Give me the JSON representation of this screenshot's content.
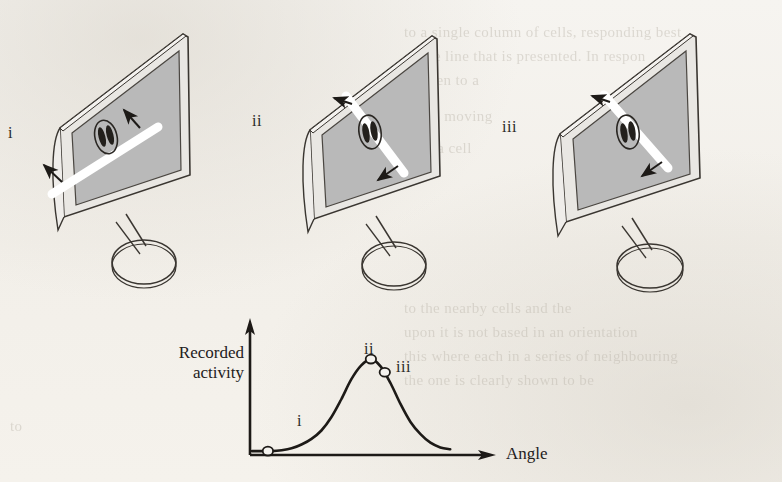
{
  "figure": {
    "type": "orientation-tuning-diagram",
    "background_color": "#f4f2ee",
    "ink_color": "#2a2723",
    "screen_fill": "#b9b9b9",
    "bar_color": "#ffffff"
  },
  "panels": [
    {
      "id": "i",
      "label": "i",
      "label_x": 8,
      "label_y": 132,
      "bar_orientation_deg": -22,
      "description": "monitor displaying white bar tilted shallow, arrows at both ends pointing up-right and down-left"
    },
    {
      "id": "ii",
      "label": "ii",
      "label_x": 252,
      "label_y": 120,
      "bar_orientation_deg": 55,
      "description": "monitor displaying white bar tilted steeply, arrows pointing up-left and down-right"
    },
    {
      "id": "iii",
      "label": "iii",
      "label_x": 502,
      "label_y": 126,
      "bar_orientation_deg": 52,
      "description": "monitor displaying white bar tilted steeply, arrows pointing up-left and down-right"
    }
  ],
  "chart_data": {
    "type": "line",
    "title": "",
    "xlabel": "Angle",
    "ylabel": "Recorded activity",
    "grid": false,
    "legend": null,
    "x": [
      0,
      5,
      10,
      15,
      20,
      25,
      30,
      35,
      40,
      45,
      50,
      55,
      60,
      65,
      70,
      75,
      80,
      85,
      90,
      95,
      100
    ],
    "values": [
      2,
      2,
      2,
      3,
      5,
      9,
      15,
      24,
      38,
      57,
      78,
      93,
      100,
      92,
      74,
      52,
      33,
      20,
      11,
      6,
      4
    ],
    "xlim": [
      0,
      110
    ],
    "ylim": [
      0,
      115
    ],
    "annotations": [
      {
        "label": "i",
        "x": 8,
        "y": 2,
        "marker": "open-circle",
        "label_position": "above"
      },
      {
        "label": "ii",
        "x": 60,
        "y": 100,
        "marker": "open-circle",
        "label_position": "above"
      },
      {
        "label": "iii",
        "x": 67,
        "y": 86,
        "marker": "open-circle",
        "label_position": "above-right"
      }
    ]
  },
  "axis": {
    "x_label_text": "Angle",
    "y_label_line1": "Recorded",
    "y_label_line2": "activity"
  },
  "background_ghost_text": [
    {
      "text": "to a single column of cells, responding best",
      "x": 404,
      "y": 24
    },
    {
      "text": "of the line that is presented. In respon",
      "x": 404,
      "y": 48
    },
    {
      "text": "be seen to a",
      "x": 404,
      "y": 72
    },
    {
      "text": "to the moving",
      "x": 404,
      "y": 108
    },
    {
      "text": "such a cell",
      "x": 404,
      "y": 140
    },
    {
      "text": "to the nearby cells and the",
      "x": 404,
      "y": 300
    },
    {
      "text": "upon it is not based in an orientation",
      "x": 404,
      "y": 324
    },
    {
      "text": "this where each in a series of neighbouring",
      "x": 404,
      "y": 348
    },
    {
      "text": "the one is clearly shown to be",
      "x": 404,
      "y": 372
    },
    {
      "text": "to",
      "x": 10,
      "y": 418
    }
  ]
}
